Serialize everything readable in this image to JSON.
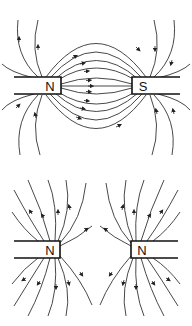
{
  "diagram": {
    "panels": [
      {
        "id": "opposite-poles",
        "left_pole": "N",
        "right_pole": "S",
        "description": "Field lines run from N pole to S pole (attraction)"
      },
      {
        "id": "like-poles",
        "left_pole": "N",
        "right_pole": "N",
        "description": "Field lines spread away from both N poles (repulsion)"
      }
    ]
  }
}
